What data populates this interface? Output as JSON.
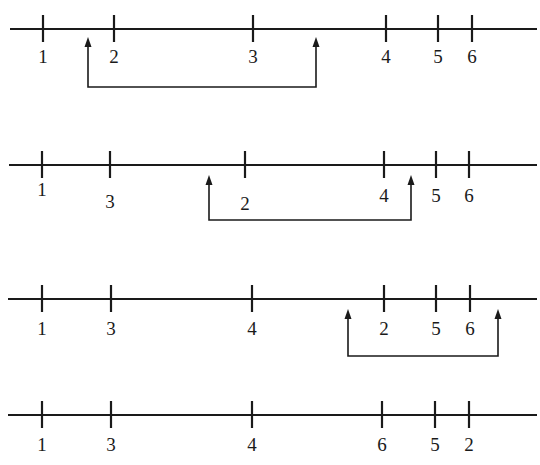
{
  "diagram": {
    "rows": [
      {
        "axis_y": 29,
        "x_start": 10,
        "x_end": 537,
        "ticks": [
          {
            "x": 43,
            "label": "1",
            "label_y": 63
          },
          {
            "x": 114,
            "label": "2",
            "label_y": 63
          },
          {
            "x": 253,
            "label": "3",
            "label_y": 63
          },
          {
            "x": 386,
            "label": "4",
            "label_y": 63
          },
          {
            "x": 438,
            "label": "5",
            "label_y": 63
          },
          {
            "x": 472,
            "label": "6",
            "label_y": 63
          }
        ],
        "bracket": {
          "x1": 88,
          "x2": 316,
          "top_y": 37,
          "bottom_y": 87
        }
      },
      {
        "axis_y": 165,
        "x_start": 9,
        "x_end": 537,
        "ticks": [
          {
            "x": 42,
            "label": "1",
            "label_y": 196
          },
          {
            "x": 110,
            "label": "3",
            "label_y": 208
          },
          {
            "x": 245,
            "label": "2",
            "label_y": 210
          },
          {
            "x": 384,
            "label": "4",
            "label_y": 202
          },
          {
            "x": 436,
            "label": "5",
            "label_y": 202
          },
          {
            "x": 469,
            "label": "6",
            "label_y": 202
          }
        ],
        "bracket": {
          "x1": 209,
          "x2": 411,
          "top_y": 175,
          "bottom_y": 220
        }
      },
      {
        "axis_y": 299,
        "x_start": 8,
        "x_end": 537,
        "ticks": [
          {
            "x": 42,
            "label": "1",
            "label_y": 335
          },
          {
            "x": 111,
            "label": "3",
            "label_y": 335
          },
          {
            "x": 252,
            "label": "4",
            "label_y": 335
          },
          {
            "x": 384,
            "label": "2",
            "label_y": 335
          },
          {
            "x": 436,
            "label": "5",
            "label_y": 335
          },
          {
            "x": 470,
            "label": "6",
            "label_y": 335
          }
        ],
        "bracket": {
          "x1": 348,
          "x2": 498,
          "top_y": 309,
          "bottom_y": 356
        }
      },
      {
        "axis_y": 415,
        "x_start": 8,
        "x_end": 537,
        "ticks": [
          {
            "x": 42,
            "label": "1",
            "label_y": 451
          },
          {
            "x": 111,
            "label": "3",
            "label_y": 451
          },
          {
            "x": 252,
            "label": "4",
            "label_y": 451
          },
          {
            "x": 382,
            "label": "6",
            "label_y": 451
          },
          {
            "x": 435,
            "label": "5",
            "label_y": 451
          },
          {
            "x": 469,
            "label": "2",
            "label_y": 451
          }
        ],
        "bracket": null
      }
    ]
  }
}
